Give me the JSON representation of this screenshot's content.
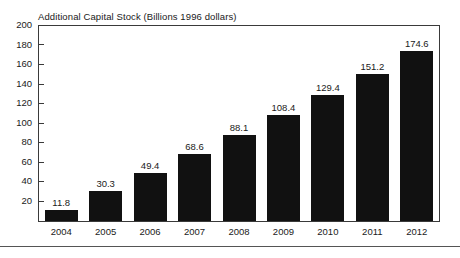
{
  "chart_data": {
    "type": "bar",
    "title": "Additional Capital Stock (Billions 1996 dollars)",
    "xlabel": "",
    "ylabel": "",
    "categories": [
      "2004",
      "2005",
      "2006",
      "2007",
      "2008",
      "2009",
      "2010",
      "2011",
      "2012"
    ],
    "values": [
      11.8,
      30.3,
      49.4,
      68.6,
      88.1,
      108.4,
      129.4,
      151.2,
      174.6
    ],
    "value_labels": [
      "11.8",
      "30.3",
      "49.4",
      "68.6",
      "88.1",
      "108.4",
      "129.4",
      "151.2",
      "174.6"
    ],
    "ylim": [
      0,
      200
    ],
    "yticks": [
      200,
      180,
      160,
      140,
      120,
      100,
      80,
      60,
      40,
      20
    ],
    "ytick_labels": [
      "200",
      "180",
      "160",
      "140",
      "120",
      "100",
      "80",
      "60",
      "40",
      "20"
    ],
    "grid": false,
    "legend": null,
    "bar_color": "#111111",
    "frame_color": "#3a3a3a",
    "background": "#ffffff"
  },
  "figure": {
    "title": "Additional Capital Stock (Billions 1996 dollars)"
  }
}
